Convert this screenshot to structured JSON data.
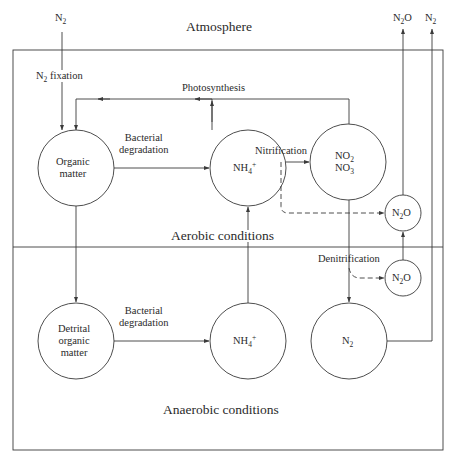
{
  "zones": {
    "atmosphere": "Atmosphere",
    "aerobic": "Aerobic conditions",
    "anaerobic": "Anaerobic conditions"
  },
  "atmosphere_labels": {
    "n2_in": {
      "base": "N",
      "sub": "2",
      "tail": ""
    },
    "n2o_out": {
      "base": "N",
      "sub": "2",
      "tail": "O"
    },
    "n2_out": {
      "base": "N",
      "sub": "2",
      "tail": ""
    }
  },
  "nodes": {
    "organic_matter": {
      "line1": "Organic",
      "line2": "matter"
    },
    "nh4_aerobic": {
      "base": "NH",
      "sub": "4",
      "sup": "+"
    },
    "no2_no3": {
      "l1_base": "NO",
      "l1_sub": "2",
      "l2_base": "NO",
      "l2_sub": "3"
    },
    "n2o_aerobic": {
      "base": "N",
      "sub": "2",
      "tail": "O"
    },
    "n2o_anaerobic": {
      "base": "N",
      "sub": "2",
      "tail": "O"
    },
    "detrital_organic_matter": {
      "line1": "Detrital",
      "line2": "organic",
      "line3": "matter"
    },
    "nh4_anaerobic": {
      "base": "NH",
      "sub": "4",
      "sup": "+"
    },
    "n2_anaerobic": {
      "base": "N",
      "sub": "2"
    }
  },
  "processes": {
    "n2_fixation": {
      "base": "N",
      "sub": "2",
      "tail": " fixation"
    },
    "photosynthesis": "Photosynthesis",
    "bacterial_degradation_aerobic": {
      "line1": "Bacterial",
      "line2": "degradation"
    },
    "nitrification": "Nitrification",
    "bacterial_degradation_anaerobic": {
      "line1": "Bacterial",
      "line2": "degradation"
    },
    "denitrification": "Denitrification"
  },
  "colors": {
    "line": "#3a3a3a",
    "background": "#ffffff"
  }
}
